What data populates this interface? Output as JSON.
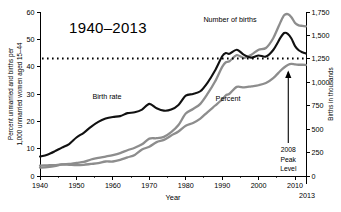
{
  "chart_data": {
    "type": "line",
    "title": "1940–2013",
    "xlabel": "Year",
    "ylabel": "Percent unmarried and births per 1,000 unmarried women aged 15–44",
    "ylabel_line1": "Percent unmarried and births per",
    "ylabel_line2": "1,000 unmarried women aged 15–44",
    "y2label": "Births in thousands",
    "xlim": [
      1940,
      2013
    ],
    "ylim": [
      0,
      60
    ],
    "y2lim": [
      0,
      1750
    ],
    "grid": false,
    "legend_position": "inline-annotations",
    "xticks": [
      1940,
      1950,
      1960,
      1970,
      1980,
      1990,
      2000,
      2010
    ],
    "xticklabels": [
      "1940",
      "1950",
      "1960",
      "1970",
      "1980",
      "1990",
      "2000",
      "2010"
    ],
    "x_end_label": "2013",
    "yticks": [
      0,
      10,
      20,
      30,
      40,
      50,
      60
    ],
    "yticklabels": [
      "0",
      "10",
      "20",
      "30",
      "40",
      "50",
      "60"
    ],
    "y2ticks": [
      0,
      250,
      500,
      750,
      1000,
      1250,
      1500,
      1750
    ],
    "y2ticklabels": [
      "0",
      "250",
      "500",
      "750",
      "1,000",
      "1,250",
      "1,500",
      "1,750"
    ],
    "reference_line": {
      "label": "dotted reference level",
      "y_left": 43,
      "y_right": 1250,
      "style": "dotted"
    },
    "annotations": [
      {
        "name": "peak-annotation",
        "lines": [
          "2008",
          "Peak",
          "Level"
        ],
        "points_to_year": 2008,
        "arrow": "up"
      }
    ],
    "colors": {
      "birth_rate": "#111111",
      "number_of_births": "#8d8d8d",
      "percent": "#8d8d8d",
      "reference_line": "#000000",
      "background": "#ffffff"
    },
    "series": [
      {
        "name": "Birth rate",
        "label": "Birth rate",
        "color": "#111111",
        "axis": "left",
        "unit": "births per 1,000 unmarried women aged 15-44",
        "x": [
          1940,
          1942,
          1944,
          1946,
          1948,
          1950,
          1952,
          1954,
          1956,
          1958,
          1960,
          1962,
          1964,
          1966,
          1968,
          1970,
          1972,
          1974,
          1976,
          1978,
          1980,
          1982,
          1984,
          1986,
          1988,
          1990,
          1991,
          1992,
          1994,
          1996,
          1998,
          2000,
          2002,
          2004,
          2006,
          2007,
          2008,
          2009,
          2010,
          2011,
          2012,
          2013
        ],
        "values": [
          7.1,
          7.8,
          9.0,
          10.4,
          11.7,
          14.1,
          15.8,
          18.0,
          19.8,
          21.0,
          21.6,
          21.9,
          23.0,
          23.3,
          24.3,
          26.4,
          24.8,
          23.9,
          24.3,
          26.0,
          29.4,
          30.0,
          31.0,
          34.2,
          38.5,
          43.8,
          45.0,
          44.7,
          46.2,
          44.3,
          43.3,
          44.1,
          43.7,
          46.1,
          50.6,
          52.3,
          52.0,
          50.3,
          47.5,
          46.0,
          45.3,
          44.8
        ]
      },
      {
        "name": "Number of births",
        "label": "Number of births",
        "color": "#8d8d8d",
        "axis": "right",
        "unit": "thousands of births",
        "x": [
          1940,
          1942,
          1944,
          1946,
          1948,
          1950,
          1952,
          1954,
          1956,
          1958,
          1960,
          1962,
          1964,
          1966,
          1968,
          1970,
          1972,
          1974,
          1976,
          1978,
          1980,
          1982,
          1984,
          1986,
          1988,
          1990,
          1991,
          1992,
          1994,
          1996,
          1998,
          2000,
          2002,
          2004,
          2006,
          2007,
          2008,
          2009,
          2010,
          2011,
          2012,
          2013
        ],
        "values": [
          89,
          95,
          105,
          125,
          129,
          141,
          150,
          176,
          193,
          208,
          224,
          245,
          275,
          302,
          339,
          399,
          403,
          418,
          468,
          544,
          666,
          715,
          770,
          878,
          1005,
          1165,
          1214,
          1225,
          1290,
          1260,
          1294,
          1347,
          1366,
          1470,
          1642,
          1715,
          1727,
          1694,
          1633,
          1608,
          1602,
          1596
        ]
      },
      {
        "name": "Percent",
        "label": "Percent",
        "color": "#8d8d8d",
        "axis": "left",
        "unit": "percent of all births that are nonmarital",
        "x": [
          1940,
          1942,
          1944,
          1946,
          1948,
          1950,
          1952,
          1954,
          1956,
          1958,
          1960,
          1962,
          1964,
          1966,
          1968,
          1970,
          1972,
          1974,
          1976,
          1978,
          1980,
          1982,
          1984,
          1986,
          1988,
          1990,
          1991,
          1992,
          1994,
          1996,
          1998,
          2000,
          2002,
          2004,
          2006,
          2007,
          2008,
          2009,
          2010,
          2011,
          2012,
          2013
        ],
        "values": [
          3.8,
          3.9,
          4.0,
          4.2,
          4.1,
          4.0,
          4.1,
          4.4,
          4.7,
          5.3,
          5.3,
          5.9,
          6.8,
          7.7,
          9.7,
          10.7,
          12.4,
          13.2,
          14.8,
          16.3,
          18.4,
          19.4,
          21.0,
          23.4,
          25.7,
          28.0,
          29.5,
          30.1,
          32.6,
          32.4,
          32.8,
          33.2,
          34.0,
          35.8,
          38.5,
          39.7,
          40.6,
          41.0,
          40.8,
          40.7,
          40.7,
          40.6
        ]
      }
    ]
  }
}
